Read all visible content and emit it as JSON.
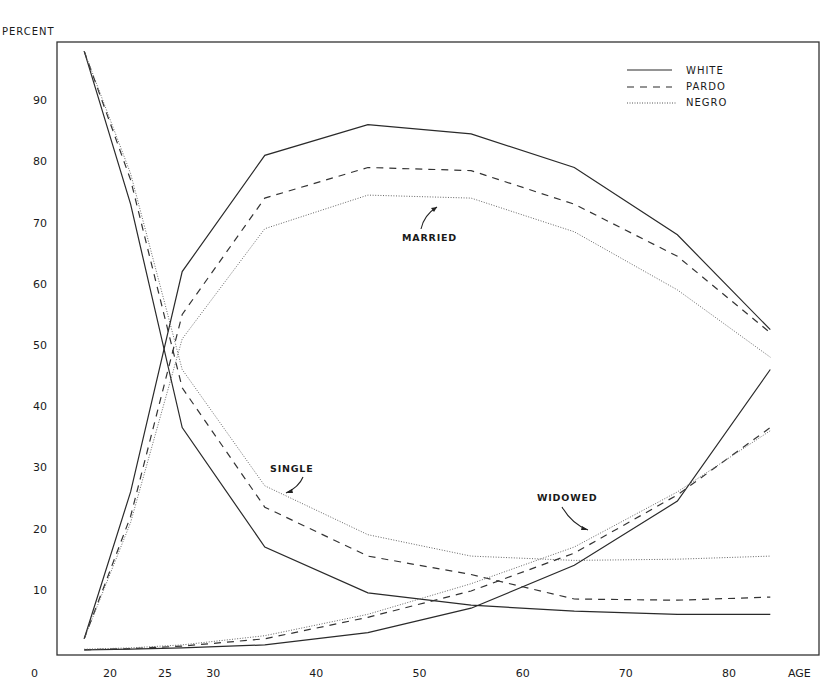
{
  "chart_data": {
    "type": "line",
    "title": "",
    "xlabel": "AGE",
    "ylabel": "PERCENT",
    "x_ticks": [
      0,
      20,
      25,
      30,
      40,
      50,
      60,
      70,
      80
    ],
    "y_ticks": [
      10,
      20,
      30,
      40,
      50,
      60,
      70,
      80,
      90
    ],
    "ylim": [
      0,
      100
    ],
    "xlim": [
      15,
      88
    ],
    "grid": false,
    "legend_position": "upper right",
    "legend": [
      {
        "name": "WHITE",
        "style": "solid"
      },
      {
        "name": "PARDO",
        "style": "dashed"
      },
      {
        "name": "NEGRO",
        "style": "dotted"
      }
    ],
    "x": [
      17.5,
      22,
      27,
      35,
      45,
      55,
      65,
      75,
      84
    ],
    "series": [
      {
        "name": "Married - White",
        "group": "MARRIED",
        "race": "WHITE",
        "style": "solid",
        "values": [
          2,
          26,
          62,
          81,
          86,
          84.5,
          79,
          68,
          52.5
        ]
      },
      {
        "name": "Married - Pardo",
        "group": "MARRIED",
        "race": "PARDO",
        "style": "dashed",
        "values": [
          2,
          22,
          55,
          74,
          79,
          78.5,
          73,
          64.5,
          52
        ]
      },
      {
        "name": "Married - Negro",
        "group": "MARRIED",
        "race": "NEGRO",
        "style": "dotted",
        "values": [
          2,
          21,
          51,
          69,
          74.5,
          74,
          68.5,
          59,
          48
        ]
      },
      {
        "name": "Single - White",
        "group": "SINGLE",
        "race": "WHITE",
        "style": "solid",
        "values": [
          98,
          73,
          36.5,
          17,
          9.5,
          7.5,
          6.5,
          6,
          6
        ]
      },
      {
        "name": "Single - Pardo",
        "group": "SINGLE",
        "race": "PARDO",
        "style": "dashed",
        "values": [
          98,
          77,
          43,
          23.5,
          15.5,
          12.5,
          8.5,
          8.3,
          8.8
        ]
      },
      {
        "name": "Single - Negro",
        "group": "SINGLE",
        "race": "NEGRO",
        "style": "dotted",
        "values": [
          98,
          78,
          46,
          27,
          19,
          15.5,
          14.8,
          15,
          15.5
        ]
      },
      {
        "name": "Widowed - White",
        "group": "WIDOWED",
        "race": "WHITE",
        "style": "solid",
        "values": [
          0.2,
          0.3,
          0.5,
          1,
          3,
          7,
          14,
          24.5,
          46
        ]
      },
      {
        "name": "Widowed - Pardo",
        "group": "WIDOWED",
        "race": "PARDO",
        "style": "dashed",
        "values": [
          0.2,
          0.4,
          0.8,
          2,
          5.5,
          9.8,
          16,
          25.5,
          36.5
        ]
      },
      {
        "name": "Widowed - Negro",
        "group": "WIDOWED",
        "race": "NEGRO",
        "style": "dotted",
        "values": [
          0.3,
          0.5,
          1,
          2.5,
          6,
          11,
          17,
          26,
          36
        ]
      }
    ],
    "annotations": [
      {
        "text": "MARRIED",
        "x": 47,
        "y": 67
      },
      {
        "text": "SINGLE",
        "x": 34,
        "y": 32
      },
      {
        "text": "WIDOWED",
        "x": 62,
        "y": 22
      }
    ]
  },
  "labels": {
    "ylabel": "PERCENT",
    "xlabel": "AGE",
    "x_zero": "0",
    "legend_white": "WHITE",
    "legend_pardo": "PARDO",
    "legend_negro": "NEGRO",
    "ann_married": "MARRIED",
    "ann_single": "SINGLE",
    "ann_widowed": "WIDOWED"
  },
  "colors": {
    "ink": "#2a2a2a",
    "frame": "#333333",
    "background": "#ffffff"
  }
}
